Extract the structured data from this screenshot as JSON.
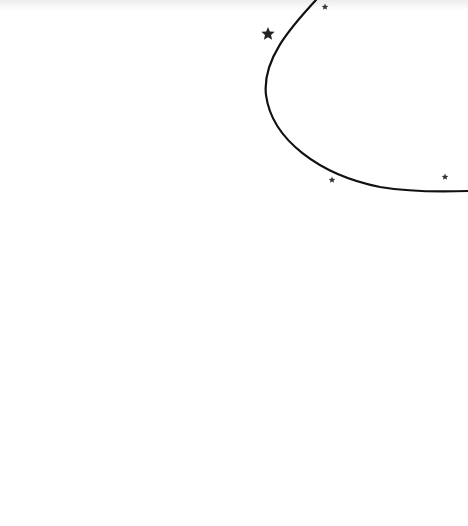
{
  "canvas": {
    "width": 468,
    "height": 526,
    "background": "#ffffff"
  },
  "artwork": {
    "curve": {
      "color": "#111111",
      "stroke_width": 2.2
    },
    "stars": [
      {
        "name": "star-large",
        "cx": 268,
        "cy": 34,
        "r": 7,
        "color": "#222222"
      },
      {
        "name": "star-small-top",
        "cx": 325,
        "cy": 7,
        "r": 3.5,
        "color": "#333333"
      },
      {
        "name": "star-small-bottom-left",
        "cx": 332,
        "cy": 180,
        "r": 3.5,
        "color": "#333333"
      },
      {
        "name": "star-small-bottom-right",
        "cx": 445,
        "cy": 177,
        "r": 3.5,
        "color": "#333333"
      }
    ]
  }
}
